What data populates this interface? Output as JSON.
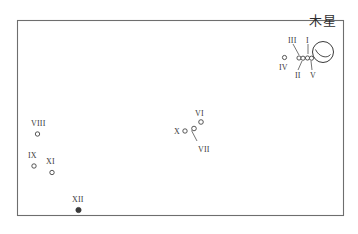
{
  "figure": {
    "title_cjk": "木星",
    "frame": {
      "x": 17,
      "y": 20,
      "w": 326,
      "h": 195,
      "stroke": "#6e6e6e"
    },
    "background": "#ffffff",
    "ink": "#3a3a3a"
  },
  "planet": {
    "name": "Jupiter",
    "label": "木星",
    "label_x": 309,
    "label_y": 14,
    "cx": 323,
    "cy": 52,
    "r": 10.5,
    "belt_arc": "M315.5,49.5 C319,57 327,59 330.5,54.5"
  },
  "leaders": [
    {
      "name": "leader-III",
      "x1": 293,
      "y1": 44,
      "x2": 299,
      "y2": 55
    },
    {
      "name": "leader-I",
      "x1": 308,
      "y1": 44,
      "x2": 308,
      "y2": 54
    },
    {
      "name": "leader-II",
      "x1": 298,
      "y1": 70,
      "x2": 302,
      "y2": 61
    },
    {
      "name": "leader-V",
      "x1": 312,
      "y1": 70,
      "x2": 311,
      "y2": 61
    }
  ],
  "moons": [
    {
      "id": "IV",
      "label": "IV",
      "cx": 284.5,
      "cy": 57.5,
      "r": 2.1,
      "filled": false,
      "label_x": 279,
      "label_y": 64
    },
    {
      "id": "III",
      "label": "III",
      "cx": 299.0,
      "cy": 58.0,
      "r": 2.1,
      "filled": false,
      "label_x": 288,
      "label_y": 37
    },
    {
      "id": "II",
      "label": "II",
      "cx": 303.0,
      "cy": 58.2,
      "r": 2.1,
      "filled": false,
      "label_x": 295,
      "label_y": 72
    },
    {
      "id": "I",
      "label": "I",
      "cx": 307.5,
      "cy": 58.0,
      "r": 2.1,
      "filled": false,
      "label_x": 306,
      "label_y": 37
    },
    {
      "id": "V",
      "label": "V",
      "cx": 311.5,
      "cy": 58.2,
      "r": 2.1,
      "filled": false,
      "label_x": 310,
      "label_y": 72
    },
    {
      "id": "VI",
      "label": "VI",
      "cx": 201.0,
      "cy": 122.0,
      "r": 2.3,
      "filled": false,
      "label_x": 195,
      "label_y": 110
    },
    {
      "id": "VII",
      "label": "VII",
      "cx": 194.0,
      "cy": 128.5,
      "r": 2.3,
      "filled": false,
      "label_x": 198,
      "label_y": 146
    },
    {
      "id": "X",
      "label": "X",
      "cx": 185.0,
      "cy": 131.0,
      "r": 2.2,
      "filled": false,
      "label_x": 174,
      "label_y": 128
    },
    {
      "id": "VIII",
      "label": "VIII",
      "cx": 37.5,
      "cy": 134.0,
      "r": 2.2,
      "filled": false,
      "label_x": 31,
      "label_y": 120
    },
    {
      "id": "IX",
      "label": "IX",
      "cx": 34.0,
      "cy": 166.0,
      "r": 2.2,
      "filled": false,
      "label_x": 28,
      "label_y": 152
    },
    {
      "id": "XI",
      "label": "XI",
      "cx": 52.0,
      "cy": 172.5,
      "r": 2.2,
      "filled": false,
      "label_x": 46,
      "label_y": 158
    },
    {
      "id": "XII",
      "label": "XII",
      "cx": 78.5,
      "cy": 210.0,
      "r": 2.6,
      "filled": true,
      "label_x": 72,
      "label_y": 196
    }
  ],
  "vii_pointer": {
    "x1": 197,
    "y1": 141,
    "x2": 191.5,
    "y2": 130.5
  }
}
